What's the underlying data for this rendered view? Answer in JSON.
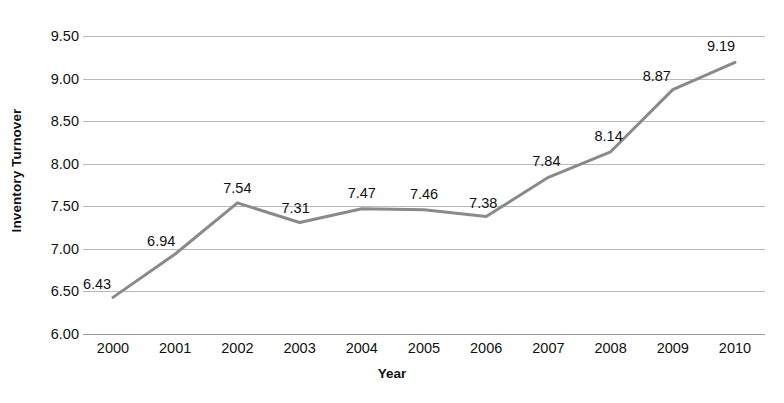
{
  "chart_data": {
    "type": "line",
    "title": "",
    "xlabel": "Year",
    "ylabel": "Inventory Turnover",
    "categories": [
      "2000",
      "2001",
      "2002",
      "2003",
      "2004",
      "2005",
      "2006",
      "2007",
      "2008",
      "2009",
      "2010"
    ],
    "values": [
      6.43,
      6.94,
      7.54,
      7.31,
      7.47,
      7.46,
      7.38,
      7.84,
      8.14,
      8.87,
      9.19
    ],
    "data_labels": [
      "6.43",
      "6.94",
      "7.54",
      "7.31",
      "7.47",
      "7.46",
      "7.38",
      "7.84",
      "8.14",
      "8.87",
      "9.19"
    ],
    "ylim": [
      6.0,
      9.5
    ],
    "ytick_values": [
      9.5,
      9.0,
      8.5,
      8.0,
      7.5,
      7.0,
      6.5,
      6.0
    ],
    "ytick_labels": [
      "9.50",
      "9.00",
      "8.50",
      "8.00",
      "7.50",
      "7.00",
      "6.50",
      "6.00"
    ],
    "ytick_step": 0.5,
    "grid": "horizontal",
    "legend": "none",
    "markers": "none",
    "series": [
      {
        "name": "Inventory Turnover",
        "values": [
          6.43,
          6.94,
          7.54,
          7.31,
          7.47,
          7.46,
          7.38,
          7.84,
          8.14,
          8.87,
          9.19
        ]
      }
    ],
    "colors": {
      "line": "#8a8a8a",
      "gridline": "#b9b9b9",
      "baseline": "#9a9a9a",
      "text": "#111111",
      "background": "#ffffff"
    },
    "label_offsets": [
      {
        "dx": -16,
        "dy": -6
      },
      {
        "dx": -14,
        "dy": -6
      },
      {
        "dx": 0,
        "dy": -8
      },
      {
        "dx": -4,
        "dy": -7
      },
      {
        "dx": 0,
        "dy": -9
      },
      {
        "dx": 0,
        "dy": -9
      },
      {
        "dx": -3,
        "dy": -7
      },
      {
        "dx": -2,
        "dy": -9
      },
      {
        "dx": -2,
        "dy": -9
      },
      {
        "dx": -16,
        "dy": -7
      },
      {
        "dx": -14,
        "dy": -9
      }
    ]
  }
}
